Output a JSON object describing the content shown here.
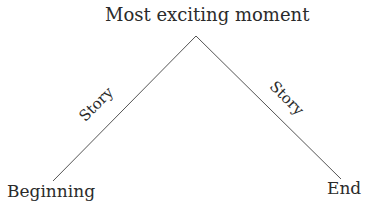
{
  "diagram": {
    "title": "Most exciting moment",
    "start_label": "Beginning",
    "end_label": "End",
    "left_edge_label": "Story",
    "right_edge_label": "Story",
    "line_color": "#555555",
    "text_color": "#2b2b2b",
    "points": {
      "beginning": [
        53,
        181
      ],
      "apex": [
        196,
        36
      ],
      "end": [
        341,
        179
      ]
    }
  }
}
